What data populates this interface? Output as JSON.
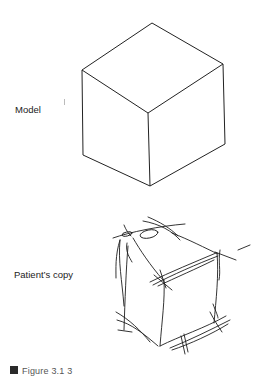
{
  "figure": {
    "labels": {
      "model": "Model",
      "patient_copy": "Patient’s copy"
    },
    "caption": {
      "text": "Figure 3.1 3",
      "truncated": true
    },
    "model_cube": {
      "stroke_color": "#222222",
      "vertices": {
        "top": [
          152,
          23
        ],
        "left": [
          82,
          70
        ],
        "right": [
          223,
          64
        ],
        "center": [
          148,
          113
        ],
        "bottom_left": [
          83,
          155
        ],
        "bottom_right": [
          225,
          144
        ],
        "bottom": [
          150,
          186
        ]
      }
    },
    "patient_sketch": {
      "stroke_color": "#1e1e1e",
      "description": "Distorted, perseverative copy of the cube with overdrawn and crossing lines"
    }
  }
}
